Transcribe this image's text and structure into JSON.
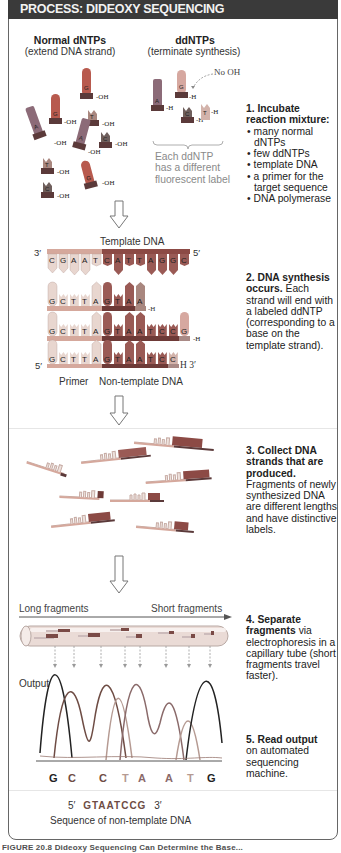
{
  "header": {
    "title": "PROCESS: DIDEOXY SEQUENCING"
  },
  "colors": {
    "header_bg": "#3a3a3a",
    "base_G": "#b85a4e",
    "base_A": "#8c6b78",
    "base_T": "#a9877f",
    "base_C": "#6f5f5c",
    "primer": "#d9bfb3",
    "template_light": "#cfa79b",
    "template_dark": "#8c4a45",
    "trace_G": "#222222",
    "trace_C": "#6e4c44",
    "trace_T": "#b59a92",
    "trace_A": "#8a6a6a"
  },
  "section1": {
    "normal_title": "Normal dNTPs",
    "normal_sub": "(extend DNA strand)",
    "dd_title": "ddNTPs",
    "dd_sub": "(terminate synthesis)",
    "no_oh_label": "No OH",
    "oh": "OH",
    "h": "H",
    "dntps": [
      "G",
      "G",
      "T",
      "A",
      "A",
      "C",
      "T",
      "G",
      "C"
    ],
    "ddntps": [
      "A",
      "G",
      "C",
      "T"
    ],
    "dd_note": [
      "Each ddNTP",
      "has a different",
      "fluorescent label"
    ],
    "step_heading": "1. Incubate reaction mixture:",
    "step_items": [
      "many normal dNTPs",
      "few ddNTPs",
      "template DNA",
      "a primer for the target sequence",
      "DNA polymerase"
    ]
  },
  "section2": {
    "template_label": "Template DNA",
    "end_3": "3′",
    "end_5": "5′",
    "template_seq": [
      "C",
      "G",
      "A",
      "A",
      "T",
      "C",
      "A",
      "T",
      "T",
      "A",
      "G",
      "G",
      "C"
    ],
    "strand1": [
      "G",
      "C",
      "T",
      "T",
      "A",
      "G",
      "T",
      "A",
      "A"
    ],
    "strand2": [
      "G",
      "C",
      "T",
      "T",
      "A",
      "G",
      "T",
      "A",
      "A",
      "T",
      "C",
      "C",
      "G"
    ],
    "strand3": [
      "G",
      "C",
      "T",
      "T",
      "A",
      "G",
      "T",
      "A",
      "A",
      "T",
      "C",
      "C"
    ],
    "h": "H",
    "bottom_5": "5′",
    "bottom_3": "H 3′",
    "primer_label": "Primer",
    "nontemplate_label": "Non-template DNA",
    "step_heading": "2. DNA synthesis occurs.",
    "step_text": "Each strand will end with a labeled ddNTP (corresponding to a base on the template strand)."
  },
  "section3": {
    "step_heading": "3. Collect DNA strands that are produced.",
    "step_text": "Fragments of newly synthesized DNA are different lengths and have distinctive labels."
  },
  "section4": {
    "long_label": "Long fragments",
    "short_label": "Short fragments",
    "step_heading": "4. Separate fragments",
    "step_text": "via electrophoresis in a capillary tube (short fragments travel faster)."
  },
  "section5": {
    "output_label": "Output",
    "bases": [
      "G",
      "C",
      "C",
      "T",
      "A",
      "A",
      "T",
      "G"
    ],
    "step_heading": "5. Read output",
    "step_text": "on automated sequencing machine.",
    "seq_5": "5′",
    "seq": "GTAATCCG",
    "seq_3": "3′",
    "seq_caption": "Sequence of non-template DNA"
  },
  "caption": {
    "text": "FIGURE 20.8 Dideoxy Sequencing Can Determine the Base..."
  }
}
